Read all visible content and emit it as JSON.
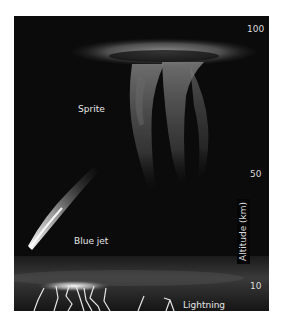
{
  "figure": {
    "background": "#0b0b0b",
    "labels": {
      "sprite": "Sprite",
      "blue_jet": "Blue jet",
      "lightning": "Lightning"
    },
    "axis": {
      "title": "Altitude (km)",
      "ticks": [
        {
          "value": "100"
        },
        {
          "value": "50"
        },
        {
          "value": "10"
        }
      ]
    }
  }
}
